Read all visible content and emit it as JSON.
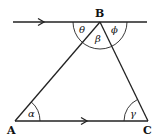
{
  "diagram": {
    "points": {
      "A": "A",
      "B": "B",
      "C": "C"
    },
    "angles": {
      "theta": "θ",
      "beta": "β",
      "phi": "ϕ",
      "alpha": "α",
      "gamma": "γ"
    }
  }
}
